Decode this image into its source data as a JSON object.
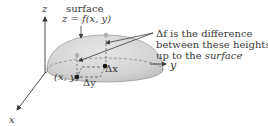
{
  "diagram": {
    "surface_label": "surface",
    "surface_equation": "z = f(x, y)",
    "annotation_line1": "Δf is the difference",
    "annotation_line2": "between these heights",
    "annotation_line3_prefix": "up to the ",
    "annotation_line3_emph": "surface",
    "axis_z": "z",
    "axis_x": "x",
    "axis_y": "y",
    "point_label": "(x, y)",
    "delta_x": "Δx",
    "delta_y": "Δy"
  },
  "colors": {
    "dome_fill": "#d6d6d6",
    "dome_edge": "#9a9a9a",
    "axis": "#3a3a3a",
    "point": "#111111",
    "surface_point": "#b0b0b0"
  }
}
